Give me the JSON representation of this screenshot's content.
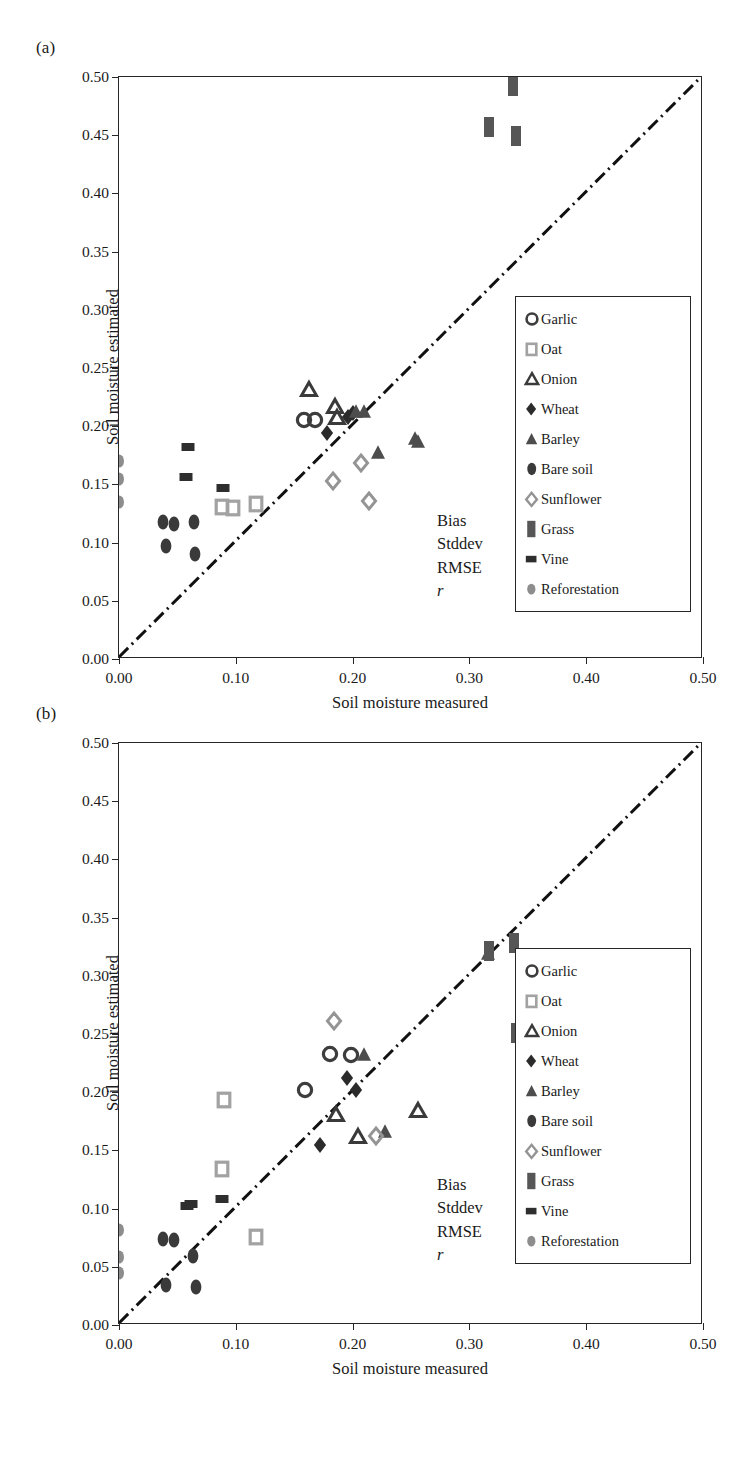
{
  "figure": {
    "panels": [
      {
        "id": "a",
        "label": "(a)",
        "axes": {
          "xlabel": "Soil moisture measured",
          "ylabel": "Soil moisture estimated",
          "xlim": [
            0.0,
            0.5
          ],
          "ylim": [
            0.0,
            0.5
          ],
          "xticks": [
            "0.00",
            "0.10",
            "0.20",
            "0.30",
            "0.40",
            "0.50"
          ],
          "xtick_values": [
            0.0,
            0.1,
            0.2,
            0.3,
            0.4,
            0.5
          ],
          "yticks": [
            "0.00",
            "0.05",
            "0.10",
            "0.15",
            "0.20",
            "0.25",
            "0.30",
            "0.35",
            "0.40",
            "0.45",
            "0.50"
          ],
          "ytick_values": [
            0.0,
            0.05,
            0.1,
            0.15,
            0.2,
            0.25,
            0.3,
            0.35,
            0.4,
            0.45,
            0.5
          ],
          "grid": false,
          "one_to_one_line": true
        },
        "stats": [
          {
            "key": "Bias",
            "value": "−0.05",
            "italic": false
          },
          {
            "key": "Stddev",
            "value": "0.07",
            "italic": false
          },
          {
            "key": "RMSE",
            "value": "0.08",
            "italic": false
          },
          {
            "key": "r",
            "value": "0.608",
            "italic": true
          }
        ]
      },
      {
        "id": "b",
        "label": "(b)",
        "axes": {
          "xlabel": "Soil moisture measured",
          "ylabel": "Soil moisture estimated",
          "xlim": [
            0.0,
            0.5
          ],
          "ylim": [
            0.0,
            0.5
          ],
          "xticks": [
            "0.00",
            "0.10",
            "0.20",
            "0.30",
            "0.40",
            "0.50"
          ],
          "xtick_values": [
            0.0,
            0.1,
            0.2,
            0.3,
            0.4,
            0.5
          ],
          "yticks": [
            "0.00",
            "0.05",
            "0.10",
            "0.15",
            "0.20",
            "0.25",
            "0.30",
            "0.35",
            "0.40",
            "0.45",
            "0.50"
          ],
          "ytick_values": [
            0.0,
            0.05,
            0.1,
            0.15,
            0.2,
            0.25,
            0.3,
            0.35,
            0.4,
            0.45,
            0.5
          ],
          "grid": false,
          "one_to_one_line": true
        },
        "stats": [
          {
            "key": "Bias",
            "value": "−0.01",
            "italic": false
          },
          {
            "key": "Stddev",
            "value": "0.05",
            "italic": false
          },
          {
            "key": "RMSE",
            "value": "0.05",
            "italic": false
          },
          {
            "key": "r",
            "value": "0.783",
            "italic": true
          }
        ]
      }
    ],
    "legend": {
      "entries": [
        {
          "label": "Garlic",
          "shape": "circle-filled",
          "color": "#4a4a4a",
          "icon": "garlic-marker-icon"
        },
        {
          "label": "Oat",
          "shape": "square-open",
          "color": "#9a9a9a",
          "icon": "oat-marker-icon"
        },
        {
          "label": "Onion",
          "shape": "triangle-open",
          "color": "#3a3a3a",
          "icon": "onion-marker-icon"
        },
        {
          "label": "Wheat",
          "shape": "diamond-filled",
          "color": "#2b2b2b",
          "icon": "wheat-marker-icon"
        },
        {
          "label": "Barley",
          "shape": "triangle-filled",
          "color": "#555555",
          "icon": "barley-marker-icon"
        },
        {
          "label": "Bare soil",
          "shape": "ellipse-filled",
          "color": "#3a3a3a",
          "icon": "bare-soil-marker-icon"
        },
        {
          "label": "Sunflower",
          "shape": "diamond-open",
          "color": "#8f8f8f",
          "icon": "sunflower-marker-icon"
        },
        {
          "label": "Grass",
          "shape": "rect-filled",
          "color": "#5a5a5a",
          "icon": "grass-marker-icon"
        },
        {
          "label": "Vine",
          "shape": "rect-small",
          "color": "#2b2b2b",
          "icon": "vine-marker-icon"
        },
        {
          "label": "Reforestation",
          "shape": "ellipse-gray",
          "color": "#8a8a8a",
          "icon": "reforestation-marker-icon"
        }
      ]
    }
  },
  "chart_data": [
    {
      "type": "scatter",
      "panel": "a",
      "title": "(a)",
      "xlabel": "Soil moisture measured",
      "ylabel": "Soil moisture estimated",
      "xlim": [
        0.0,
        0.5
      ],
      "ylim": [
        0.0,
        0.5
      ],
      "grid": false,
      "legend_position": "right-inside",
      "annotations": {
        "Bias": "-0.05",
        "Stddev": "0.07",
        "RMSE": "0.08",
        "r": "0.608"
      },
      "reference_line": {
        "type": "1:1",
        "style": "dash-dot",
        "from": [
          0.0,
          0.0
        ],
        "to": [
          0.5,
          0.5
        ]
      },
      "series": [
        {
          "name": "Garlic",
          "shape": "circle-filled",
          "points": [
            [
              0.158,
              0.205
            ],
            [
              0.168,
              0.205
            ]
          ]
        },
        {
          "name": "Oat",
          "shape": "square-open",
          "points": [
            [
              0.088,
              0.131
            ],
            [
              0.098,
              0.13
            ],
            [
              0.117,
              0.133
            ]
          ]
        },
        {
          "name": "Onion",
          "shape": "triangle-open",
          "points": [
            [
              0.163,
              0.232
            ],
            [
              0.185,
              0.217
            ],
            [
              0.187,
              0.208
            ]
          ]
        },
        {
          "name": "Wheat",
          "shape": "diamond-filled",
          "points": [
            [
              0.178,
              0.194
            ],
            [
              0.196,
              0.208
            ],
            [
              0.2,
              0.211
            ]
          ]
        },
        {
          "name": "Barley",
          "shape": "triangle-filled",
          "points": [
            [
              0.203,
              0.213
            ],
            [
              0.21,
              0.213
            ],
            [
              0.222,
              0.178
            ],
            [
              0.253,
              0.19
            ],
            [
              0.256,
              0.187
            ]
          ]
        },
        {
          "name": "Bare soil",
          "shape": "ellipse-filled",
          "points": [
            [
              0.038,
              0.118
            ],
            [
              0.047,
              0.116
            ],
            [
              0.04,
              0.097
            ],
            [
              0.064,
              0.118
            ],
            [
              0.065,
              0.09
            ]
          ]
        },
        {
          "name": "Sunflower",
          "shape": "diamond-open",
          "points": [
            [
              0.183,
              0.153
            ],
            [
              0.207,
              0.168
            ],
            [
              0.214,
              0.136
            ]
          ]
        },
        {
          "name": "Grass",
          "shape": "rect-filled",
          "points": [
            [
              0.317,
              0.457
            ],
            [
              0.337,
              0.492
            ],
            [
              0.34,
              0.449
            ]
          ]
        },
        {
          "name": "Vine",
          "shape": "rect-small",
          "points": [
            [
              0.059,
              0.182
            ],
            [
              0.057,
              0.156
            ],
            [
              0.089,
              0.147
            ]
          ]
        },
        {
          "name": "Reforestation",
          "shape": "ellipse-gray",
          "points": [
            [
              0.0,
              0.17
            ],
            [
              0.0,
              0.155
            ],
            [
              0.0,
              0.135
            ]
          ]
        }
      ]
    },
    {
      "type": "scatter",
      "panel": "b",
      "title": "(b)",
      "xlabel": "Soil moisture measured",
      "ylabel": "Soil moisture estimated",
      "xlim": [
        0.0,
        0.5
      ],
      "ylim": [
        0.0,
        0.5
      ],
      "grid": false,
      "legend_position": "right-inside",
      "annotations": {
        "Bias": "-0.01",
        "Stddev": "0.05",
        "RMSE": "0.05",
        "r": "0.783"
      },
      "reference_line": {
        "type": "1:1",
        "style": "dash-dot",
        "from": [
          0.0,
          0.0
        ],
        "to": [
          0.5,
          0.5
        ]
      },
      "series": [
        {
          "name": "Garlic",
          "shape": "circle-filled",
          "points": [
            [
              0.159,
              0.202
            ],
            [
              0.181,
              0.233
            ],
            [
              0.199,
              0.232
            ]
          ]
        },
        {
          "name": "Oat",
          "shape": "square-open",
          "points": [
            [
              0.09,
              0.193
            ],
            [
              0.088,
              0.134
            ],
            [
              0.117,
              0.076
            ]
          ]
        },
        {
          "name": "Onion",
          "shape": "triangle-open",
          "points": [
            [
              0.186,
              0.181
            ],
            [
              0.205,
              0.162
            ],
            [
              0.256,
              0.185
            ]
          ]
        },
        {
          "name": "Wheat",
          "shape": "diamond-filled",
          "points": [
            [
              0.172,
              0.155
            ],
            [
              0.195,
              0.212
            ],
            [
              0.203,
              0.202
            ]
          ]
        },
        {
          "name": "Barley",
          "shape": "triangle-filled",
          "points": [
            [
              0.21,
              0.233
            ],
            [
              0.228,
              0.167
            ],
            [
              0.316,
              0.32
            ]
          ]
        },
        {
          "name": "Bare soil",
          "shape": "ellipse-filled",
          "points": [
            [
              0.038,
              0.074
            ],
            [
              0.047,
              0.073
            ],
            [
              0.04,
              0.034
            ],
            [
              0.063,
              0.059
            ],
            [
              0.066,
              0.033
            ]
          ]
        },
        {
          "name": "Sunflower",
          "shape": "diamond-open",
          "points": [
            [
              0.184,
              0.261
            ],
            [
              0.22,
              0.162
            ]
          ]
        },
        {
          "name": "Grass",
          "shape": "rect-filled",
          "points": [
            [
              0.317,
              0.321
            ],
            [
              0.338,
              0.328
            ],
            [
              0.34,
              0.251
            ]
          ]
        },
        {
          "name": "Vine",
          "shape": "rect-small",
          "points": [
            [
              0.058,
              0.102
            ],
            [
              0.062,
              0.104
            ],
            [
              0.088,
              0.108
            ]
          ]
        },
        {
          "name": "Reforestation",
          "shape": "ellipse-gray",
          "points": [
            [
              0.0,
              0.082
            ],
            [
              0.0,
              0.058
            ],
            [
              0.0,
              0.045
            ]
          ]
        }
      ]
    }
  ]
}
